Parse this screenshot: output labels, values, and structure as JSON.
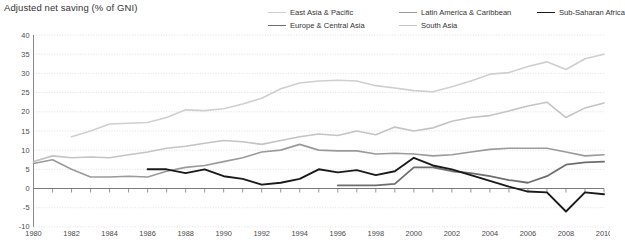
{
  "chart_data": {
    "type": "line",
    "title": "Adjusted net saving (% of GNI)",
    "xlabel": "",
    "ylabel": "",
    "xlim": [
      1980,
      2010
    ],
    "ylim": [
      -10,
      40
    ],
    "yticks": [
      -10,
      -5,
      0,
      5,
      10,
      15,
      20,
      25,
      30,
      35,
      40
    ],
    "xticks": [
      1980,
      1982,
      1984,
      1986,
      1988,
      1990,
      1992,
      1994,
      1996,
      1998,
      2000,
      2002,
      2004,
      2006,
      2008,
      2010
    ],
    "xtick_labels": [
      "1980",
      "1982",
      "1984",
      "1986",
      "1988",
      "1990",
      "1992",
      "1994",
      "1996",
      "1998",
      "2000",
      "2002",
      "2004",
      "2006",
      "2008",
      "2010"
    ],
    "ytick_labels": [
      "-10",
      "-5",
      "0",
      "5",
      "10",
      "15",
      "20",
      "25",
      "30",
      "35",
      "40"
    ],
    "grid": true,
    "grid_axis": "y",
    "legend_position": "top-right",
    "x": [
      1980,
      1981,
      1982,
      1983,
      1984,
      1985,
      1986,
      1987,
      1988,
      1989,
      1990,
      1991,
      1992,
      1993,
      1994,
      1995,
      1996,
      1997,
      1998,
      1999,
      2000,
      2001,
      2002,
      2003,
      2004,
      2005,
      2006,
      2007,
      2008,
      2009,
      2010
    ],
    "series": [
      {
        "name": "East Asia & Pacific",
        "color": "#cfcfcf",
        "width": 1.6,
        "x": [
          1982,
          1983,
          1984,
          1985,
          1986,
          1987,
          1988,
          1989,
          1990,
          1991,
          1992,
          1993,
          1994,
          1995,
          1996,
          1997,
          1998,
          1999,
          2000,
          2001,
          2002,
          2003,
          2004,
          2005,
          2006,
          2007,
          2008,
          2009,
          2010
        ],
        "values": [
          13.5,
          15.0,
          16.8,
          17.0,
          17.2,
          18.5,
          20.5,
          20.3,
          20.8,
          22.0,
          23.5,
          26.0,
          27.5,
          28.0,
          28.2,
          28.0,
          26.8,
          26.2,
          25.5,
          25.2,
          26.5,
          28.0,
          29.8,
          30.2,
          31.8,
          33.0,
          31.0,
          33.8,
          35.0
        ]
      },
      {
        "name": "South Asia",
        "color": "#c4c4c4",
        "width": 1.6,
        "x": [
          1980,
          1981,
          1982,
          1983,
          1984,
          1985,
          1986,
          1987,
          1988,
          1989,
          1990,
          1991,
          1992,
          1993,
          1994,
          1995,
          1996,
          1997,
          1998,
          1999,
          2000,
          2001,
          2002,
          2003,
          2004,
          2005,
          2006,
          2007,
          2008,
          2009,
          2010
        ],
        "values": [
          7.0,
          8.5,
          8.0,
          8.2,
          8.0,
          8.8,
          9.5,
          10.5,
          11.0,
          11.8,
          12.5,
          12.2,
          11.5,
          12.5,
          13.5,
          14.2,
          13.8,
          15.0,
          14.0,
          16.0,
          15.0,
          15.8,
          17.5,
          18.5,
          19.0,
          20.2,
          21.5,
          22.5,
          18.5,
          21.0,
          22.3
        ]
      },
      {
        "name": "Latin America & Caribbean",
        "color": "#9a9a9a",
        "width": 1.6,
        "x": [
          1980,
          1981,
          1982,
          1983,
          1984,
          1985,
          1986,
          1987,
          1988,
          1989,
          1990,
          1991,
          1992,
          1993,
          1994,
          1995,
          1996,
          1997,
          1998,
          1999,
          2000,
          2001,
          2002,
          2003,
          2004,
          2005,
          2006,
          2007,
          2008,
          2009,
          2010
        ],
        "values": [
          6.5,
          7.5,
          5.0,
          3.0,
          3.0,
          3.2,
          3.0,
          4.5,
          5.5,
          6.0,
          7.0,
          8.0,
          9.5,
          10.0,
          11.5,
          10.0,
          9.8,
          9.8,
          9.0,
          9.2,
          9.0,
          8.5,
          8.8,
          9.5,
          10.2,
          10.5,
          10.5,
          10.5,
          9.5,
          8.5,
          8.8
        ]
      },
      {
        "name": "Europe & Central Asia",
        "color": "#6e6e6e",
        "width": 1.8,
        "x": [
          1996,
          1997,
          1998,
          1999,
          2000,
          2001,
          2002,
          2003,
          2004,
          2005,
          2006,
          2007,
          2008,
          2009,
          2010
        ],
        "values": [
          0.8,
          0.8,
          0.8,
          1.2,
          5.5,
          5.5,
          4.5,
          4.0,
          3.2,
          2.2,
          1.5,
          3.2,
          6.2,
          6.8,
          7.0
        ]
      },
      {
        "name": "Sub-Saharan Africa",
        "color": "#1a1a1a",
        "width": 1.9,
        "x": [
          1986,
          1987,
          1988,
          1989,
          1990,
          1991,
          1992,
          1993,
          1994,
          1995,
          1996,
          1997,
          1998,
          1999,
          2000,
          2001,
          2002,
          2003,
          2004,
          2005,
          2006,
          2007,
          2008,
          2009,
          2010
        ],
        "values": [
          5.0,
          5.0,
          4.0,
          5.0,
          3.2,
          2.5,
          1.0,
          1.5,
          2.5,
          5.0,
          4.2,
          4.8,
          3.5,
          4.5,
          8.0,
          6.0,
          5.0,
          3.5,
          2.0,
          0.5,
          -0.8,
          -1.0,
          -6.0,
          -1.0,
          -1.5
        ]
      }
    ]
  }
}
